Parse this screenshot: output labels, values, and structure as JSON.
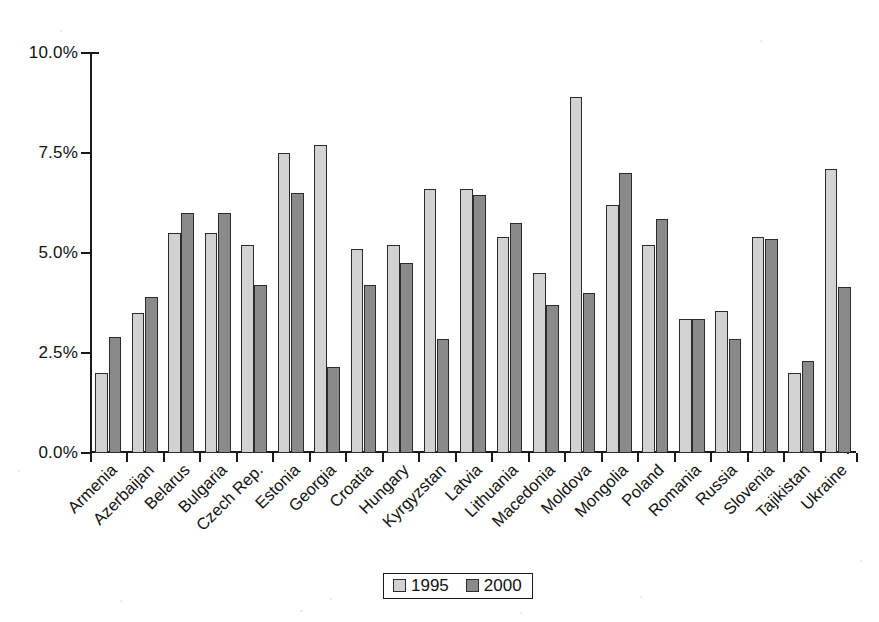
{
  "chart_data": {
    "type": "bar",
    "title": "",
    "subtitle": "",
    "xlabel": "",
    "ylabel": "",
    "ylim": [
      0,
      10
    ],
    "ytick_labels": [
      "0.0%",
      "2.5%",
      "5.0%",
      "7.5%",
      "10.0%"
    ],
    "ytick_values": [
      0,
      2.5,
      5.0,
      7.5,
      10.0
    ],
    "grid": false,
    "legend_position": "bottom-center",
    "categories": [
      "Armenia",
      "Azerbaijan",
      "Belarus",
      "Bulgaria",
      "Czech Rep.",
      "Estonia",
      "Georgia",
      "Croatia",
      "Hungary",
      "Kyrgyzstan",
      "Latvia",
      "Lithuania",
      "Macedonia",
      "Moldova",
      "Mongolia",
      "Poland",
      "Romania",
      "Russia",
      "Slovenia",
      "Tajikistan",
      "Ukraine"
    ],
    "series": [
      {
        "name": "1995",
        "color": "#d2d2d2",
        "values": [
          2.0,
          3.5,
          5.5,
          5.5,
          5.2,
          7.5,
          7.7,
          5.1,
          5.2,
          6.6,
          6.6,
          5.4,
          4.5,
          8.9,
          6.2,
          5.2,
          3.35,
          3.55,
          5.4,
          2.0,
          7.1
        ]
      },
      {
        "name": "2000",
        "color": "#8a8a8a",
        "values": [
          2.9,
          3.9,
          6.0,
          6.0,
          4.2,
          6.5,
          2.15,
          4.2,
          4.75,
          2.85,
          6.45,
          5.75,
          3.7,
          4.0,
          7.0,
          5.85,
          3.35,
          2.85,
          5.35,
          2.3,
          4.15
        ]
      }
    ]
  },
  "legend": {
    "entries": [
      {
        "label": "1995",
        "swatch": "light-gray-swatch"
      },
      {
        "label": "2000",
        "swatch": "dark-gray-swatch"
      }
    ]
  },
  "colors": {
    "series_1995": "#d2d2d2",
    "series_2000": "#8a8a8a",
    "axis": "#1a1a1a",
    "bar_outline": "#2b2b2b",
    "background": "#ffffff"
  }
}
